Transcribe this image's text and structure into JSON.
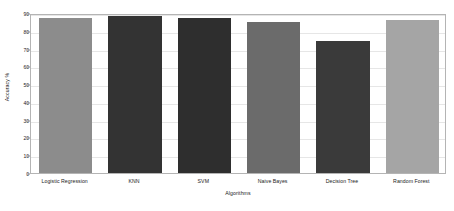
{
  "chart_data": {
    "type": "bar",
    "title": "",
    "xlabel": "Algorithms",
    "ylabel": "Accuracy %",
    "categories": [
      "Logistic Regression",
      "KNN",
      "SVM",
      "Naive Bayes",
      "Decision Tree",
      "Random Forest"
    ],
    "values": [
      87,
      88.5,
      87,
      85,
      74,
      86
    ],
    "ylim": [
      0,
      90
    ],
    "yticks": [
      0,
      10,
      20,
      30,
      40,
      50,
      60,
      70,
      80,
      90
    ],
    "ytick_labels": [
      "0",
      "10",
      "20",
      "30",
      "40",
      "50",
      "60",
      "70",
      "80",
      "90"
    ],
    "grid": true,
    "legend": "none",
    "bar_colors": [
      "#8c8c8c",
      "#333333",
      "#2e2e2e",
      "#6b6b6b",
      "#3a3a3a",
      "#a5a5a5"
    ],
    "frame_color": "#b4b4b4",
    "gridline_color": "#e6e6e6",
    "background_color": "#ffffff",
    "text_color": "#1a1a1a"
  }
}
